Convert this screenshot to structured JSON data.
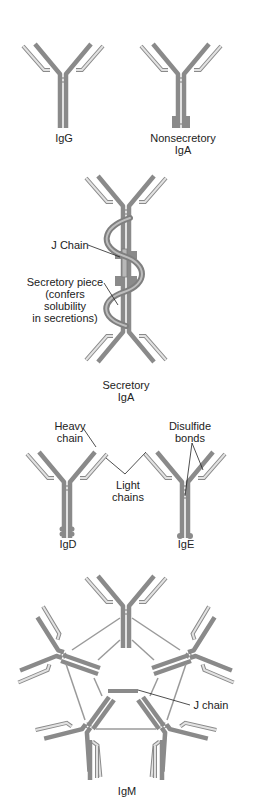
{
  "figure": {
    "colors": {
      "heavy_chain": "#8a8a8a",
      "light_chain_outline": "#8a8a8a",
      "light_chain_fill": "#e2e2e2",
      "label_text": "#222222",
      "background": "#ffffff"
    },
    "panels": [
      {
        "id": "igg",
        "label": "IgG"
      },
      {
        "id": "nonsecretory-iga",
        "label_line1": "Nonsecretory",
        "label_line2": "IgA"
      },
      {
        "id": "secretory-iga",
        "label_line1": "Secretory",
        "label_line2": "IgA",
        "annotations": {
          "j_chain": "J Chain",
          "secretory_piece_line1": "Secretory piece",
          "secretory_piece_line2": "(confers",
          "secretory_piece_line3": "solubility",
          "secretory_piece_line4": "in secretions)"
        }
      },
      {
        "id": "igd",
        "label": "IgD",
        "annotations": {
          "heavy_chain_line1": "Heavy",
          "heavy_chain_line2": "chain",
          "light_chains_line1": "Light",
          "light_chains_line2": "chains"
        }
      },
      {
        "id": "ige",
        "label": "IgE",
        "annotations": {
          "disulfide_line1": "Disulfide",
          "disulfide_line2": "bonds"
        }
      },
      {
        "id": "igm",
        "label": "IgM",
        "annotations": {
          "j_chain": "J chain"
        }
      }
    ]
  }
}
